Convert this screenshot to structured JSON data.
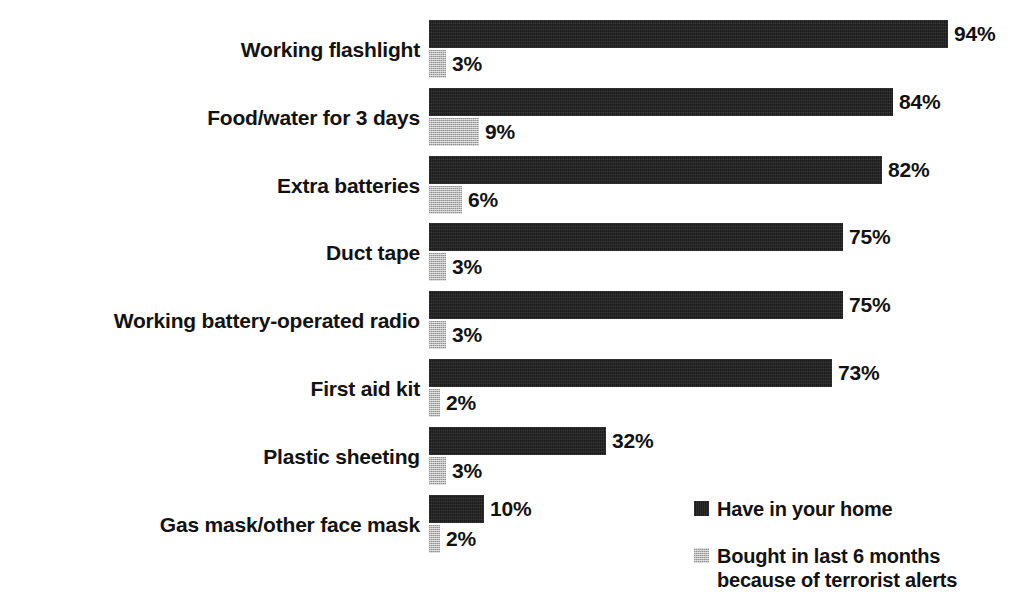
{
  "chart_data": {
    "type": "bar",
    "orientation": "horizontal",
    "title": "",
    "subtitle": "",
    "xlabel": "",
    "ylabel": "",
    "grid": false,
    "axis_visible": false,
    "xlim": [
      0,
      100
    ],
    "value_suffix": "%",
    "legend_position": "bottom-right",
    "categories": [
      "Working flashlight",
      "Food/water for 3 days",
      "Extra batteries",
      "Duct tape",
      "Working battery-operated radio",
      "First aid kit",
      "Plastic sheeting",
      "Gas mask/other face mask"
    ],
    "series": [
      {
        "name": "Have in your home",
        "color": "#1d1d1d",
        "values": [
          94,
          84,
          82,
          75,
          75,
          73,
          32,
          10
        ],
        "labels": [
          "94%",
          "84%",
          "82%",
          "75%",
          "75%",
          "73%",
          "32%",
          "10%"
        ]
      },
      {
        "name": "Bought in last 6 months\nbecause of terrorist alerts",
        "color": "#b6b6b6",
        "values": [
          3,
          9,
          6,
          3,
          3,
          2,
          3,
          2
        ],
        "labels": [
          "3%",
          "9%",
          "6%",
          "3%",
          "3%",
          "2%",
          "3%",
          "2%"
        ]
      }
    ]
  },
  "legend": {
    "items": [
      {
        "label": "Have in your home",
        "swatch": "dark"
      },
      {
        "label": "Bought in last 6 months\nbecause of terrorist alerts",
        "swatch": "light"
      }
    ]
  },
  "colors": {
    "dark_series": "#1d1d1d",
    "light_series": "#b6b6b6",
    "text": "#121212",
    "background": "#ffffff"
  }
}
